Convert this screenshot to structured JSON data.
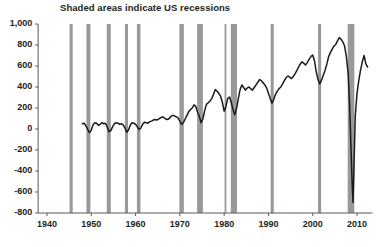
{
  "chart_data": {
    "type": "line",
    "title": "Shaded areas indicate US recessions",
    "xlabel": "",
    "ylabel": "",
    "xlim": [
      1938,
      2013.5
    ],
    "ylim": [
      -800,
      1000
    ],
    "grid": false,
    "legend_position": "none",
    "line_color": "#1a1a1a",
    "shade_color": "#999999",
    "axis_color": "#58595b",
    "y_ticks": [
      1000,
      800,
      600,
      400,
      200,
      0,
      -200,
      -400,
      -600,
      -800
    ],
    "y_tick_labels": [
      "1,000",
      "800",
      "600",
      "400",
      "200",
      "0",
      "-200",
      "-400",
      "-600",
      "-800"
    ],
    "x_ticks": [
      1940,
      1950,
      1960,
      1970,
      1980,
      1990,
      2000,
      2010
    ],
    "x_tick_labels": [
      "1940",
      "1950",
      "1960",
      "1970",
      "1980",
      "1990",
      "2000",
      "2010"
    ],
    "recessions": [
      {
        "label": "1945 recession",
        "start": 1945.1,
        "end": 1945.8
      },
      {
        "label": "1948-49 recession",
        "start": 1948.9,
        "end": 1949.8
      },
      {
        "label": "1953-54 recession",
        "start": 1953.5,
        "end": 1954.4
      },
      {
        "label": "1957-58 recession",
        "start": 1957.6,
        "end": 1958.3
      },
      {
        "label": "1960-61 recession",
        "start": 1960.3,
        "end": 1961.1
      },
      {
        "label": "1969-70 recession",
        "start": 1969.9,
        "end": 1970.9
      },
      {
        "label": "1973-75 recession",
        "start": 1973.9,
        "end": 1975.2
      },
      {
        "label": "1980 recession",
        "start": 1980.1,
        "end": 1980.5
      },
      {
        "label": "1981-82 recession",
        "start": 1981.5,
        "end": 1982.9
      },
      {
        "label": "1990-91 recession",
        "start": 1990.5,
        "end": 1991.2
      },
      {
        "label": "2001 recession",
        "start": 2001.2,
        "end": 2001.9
      },
      {
        "label": "2007-09 recession",
        "start": 2007.9,
        "end": 2009.4
      }
    ],
    "x": [
      1948.0,
      1948.4,
      1948.8,
      1949.2,
      1949.6,
      1950.0,
      1950.4,
      1950.8,
      1951.2,
      1951.6,
      1952.0,
      1952.4,
      1952.8,
      1953.2,
      1953.6,
      1954.0,
      1954.4,
      1954.8,
      1955.2,
      1955.6,
      1956.0,
      1956.4,
      1956.8,
      1957.2,
      1957.6,
      1958.0,
      1958.4,
      1958.8,
      1959.2,
      1959.6,
      1960.0,
      1960.4,
      1960.8,
      1961.2,
      1961.6,
      1962.0,
      1962.4,
      1962.8,
      1963.2,
      1963.6,
      1964.0,
      1964.4,
      1964.8,
      1965.2,
      1965.6,
      1966.0,
      1966.4,
      1966.8,
      1967.2,
      1967.6,
      1968.0,
      1968.4,
      1968.8,
      1969.2,
      1969.6,
      1970.0,
      1970.4,
      1970.8,
      1971.2,
      1971.6,
      1972.0,
      1972.4,
      1972.8,
      1973.2,
      1973.6,
      1974.0,
      1974.4,
      1974.8,
      1975.2,
      1975.6,
      1976.0,
      1976.4,
      1976.8,
      1977.2,
      1977.6,
      1978.0,
      1978.4,
      1978.8,
      1979.2,
      1979.6,
      1980.0,
      1980.4,
      1980.8,
      1981.2,
      1981.6,
      1982.0,
      1982.4,
      1982.8,
      1983.2,
      1983.6,
      1984.0,
      1984.4,
      1984.8,
      1985.2,
      1985.6,
      1986.0,
      1986.4,
      1986.8,
      1987.2,
      1987.6,
      1988.0,
      1988.4,
      1988.8,
      1989.2,
      1989.6,
      1990.0,
      1990.4,
      1990.8,
      1991.2,
      1991.6,
      1992.0,
      1992.4,
      1992.8,
      1993.2,
      1993.6,
      1994.0,
      1994.4,
      1994.8,
      1995.2,
      1995.6,
      1996.0,
      1996.4,
      1996.8,
      1997.2,
      1997.6,
      1998.0,
      1998.4,
      1998.8,
      1999.2,
      1999.6,
      2000.0,
      2000.4,
      2000.8,
      2001.2,
      2001.6,
      2002.0,
      2002.4,
      2002.8,
      2003.2,
      2003.6,
      2004.0,
      2004.4,
      2004.8,
      2005.2,
      2005.6,
      2006.0,
      2006.4,
      2006.8,
      2007.2,
      2007.6,
      2008.0,
      2008.3,
      2008.6,
      2008.9,
      2009.1,
      2009.3,
      2009.6,
      2010.0,
      2010.4,
      2010.8,
      2011.2,
      2011.6,
      2012.0,
      2012.4,
      2012.8
    ],
    "y": [
      50,
      55,
      30,
      -5,
      -35,
      -10,
      40,
      60,
      55,
      35,
      45,
      60,
      50,
      55,
      20,
      -25,
      -15,
      20,
      50,
      60,
      55,
      45,
      50,
      40,
      10,
      -30,
      -10,
      35,
      60,
      55,
      45,
      20,
      -5,
      10,
      45,
      65,
      60,
      55,
      70,
      75,
      85,
      90,
      85,
      95,
      105,
      115,
      110,
      95,
      90,
      100,
      120,
      130,
      125,
      115,
      105,
      75,
      45,
      60,
      95,
      130,
      165,
      185,
      200,
      230,
      215,
      160,
      120,
      60,
      95,
      175,
      235,
      250,
      265,
      290,
      330,
      375,
      360,
      340,
      310,
      255,
      170,
      215,
      290,
      305,
      255,
      185,
      135,
      195,
      290,
      375,
      420,
      395,
      370,
      390,
      400,
      385,
      370,
      395,
      420,
      445,
      470,
      460,
      440,
      420,
      390,
      340,
      290,
      245,
      280,
      330,
      360,
      385,
      400,
      430,
      460,
      490,
      505,
      495,
      480,
      500,
      525,
      555,
      590,
      620,
      640,
      625,
      610,
      635,
      665,
      690,
      705,
      650,
      545,
      470,
      430,
      465,
      515,
      560,
      620,
      690,
      730,
      760,
      790,
      805,
      840,
      870,
      855,
      830,
      790,
      690,
      530,
      260,
      -120,
      -520,
      -700,
      -390,
      120,
      340,
      460,
      560,
      640,
      700,
      620,
      590
    ]
  }
}
